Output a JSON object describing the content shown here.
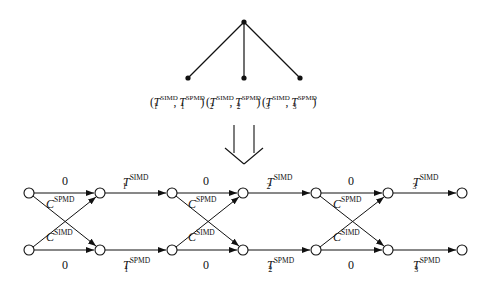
{
  "tree": {
    "leaves": [
      {
        "index": "1",
        "sup_simd": "SIMD",
        "sup_spmd": "SPMD",
        "var": "T"
      },
      {
        "index": "2",
        "sup_simd": "SIMD",
        "sup_spmd": "SPMD",
        "var": "T"
      },
      {
        "index": "3",
        "sup_simd": "SIMD",
        "sup_spmd": "SPMD",
        "var": "T"
      }
    ]
  },
  "graph": {
    "zero_label": "0",
    "c_var": "C",
    "c_top_sup": "SPMD",
    "c_bottom_sup": "SIMD",
    "stages": [
      {
        "index": "1",
        "top_sup": "SIMD",
        "bottom_sup": "SPMD",
        "var": "T"
      },
      {
        "index": "2",
        "top_sup": "SIMD",
        "bottom_sup": "SPMD",
        "var": "T"
      },
      {
        "index": "3",
        "top_sup": "SIMD",
        "bottom_sup": "SPMD",
        "var": "T"
      }
    ]
  },
  "punct": {
    "open": "(",
    "close": ")",
    "comma": ","
  }
}
